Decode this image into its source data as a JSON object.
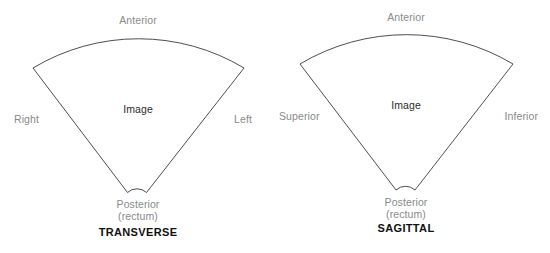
{
  "figure": {
    "type": "anatomical-orientation-diagram",
    "background_color": "#ffffff",
    "outline_color": "#3a3a3a",
    "label_color": "#8a8a8a",
    "title_color": "#111111"
  },
  "panels": [
    {
      "id": "transverse",
      "title": "TRANSVERSE",
      "image_label": "Image",
      "labels": {
        "top": "Anterior",
        "left": "Right",
        "right": "Left",
        "apex_line1": "Posterior",
        "apex_line2": "(rectum)"
      }
    },
    {
      "id": "sagittal",
      "title": "SAGITTAL",
      "image_label": "Image",
      "labels": {
        "top": "Anterior",
        "left": "Superior",
        "right": "Inferior",
        "apex_line1": "Posterior",
        "apex_line2": "(rectum)"
      }
    }
  ]
}
